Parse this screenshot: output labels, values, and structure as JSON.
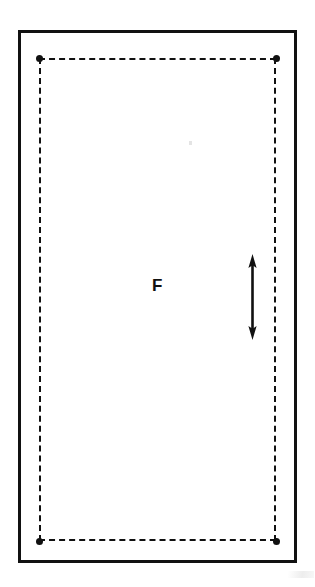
{
  "figure": {
    "background_color": "#ffffff",
    "line_color": "#111111",
    "width": 315,
    "height": 587
  },
  "outer_frame": {
    "name": "outer solid rectangle",
    "style": "solid",
    "stroke_width_px": 3,
    "color": "#111111"
  },
  "dashed_region": {
    "name": "inner dashed rectangle",
    "style": "dashed",
    "stroke_width_px": 2.6,
    "color": "#111111",
    "dash_length_px": 16,
    "dash_gap_px": 8,
    "corner_markers": {
      "shape": "filled circle",
      "diameter_px": 7,
      "color": "#111111",
      "count": 4
    }
  },
  "labels": {
    "region_label": "F"
  },
  "dimension_arrow": {
    "name": "vertical double headed arrow",
    "orientation": "vertical",
    "heads": "both",
    "color": "#111111",
    "length_px": 85
  },
  "artifacts": {
    "speck": "faint scan speck",
    "smudge": "faint scan smudge"
  }
}
